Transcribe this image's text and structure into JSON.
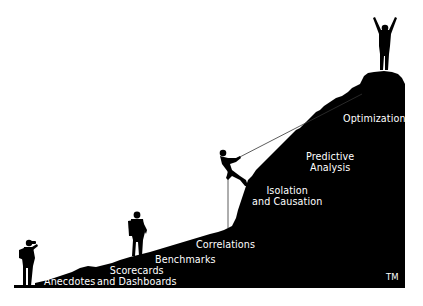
{
  "graphic": {
    "title": "Analytics maturity mountain",
    "colors": {
      "silhouette": "#000000",
      "background": "#ffffff",
      "label": "#ffffff",
      "rope": "#3a3a3a"
    },
    "figures": [
      {
        "name": "hiker-at-base",
        "icon": "person-with-binoculars-icon"
      },
      {
        "name": "hiker-on-slope",
        "icon": "hiker-with-backpack-icon"
      },
      {
        "name": "rope-climber",
        "icon": "climber-icon"
      },
      {
        "name": "summit-person",
        "icon": "celebrating-person-icon"
      }
    ],
    "stages": [
      {
        "line1": "Anecdotes",
        "line2": ""
      },
      {
        "line1": "Scorecards",
        "line2": "and Dashboards"
      },
      {
        "line1": "Benchmarks",
        "line2": ""
      },
      {
        "line1": "Correlations",
        "line2": ""
      },
      {
        "line1": "Isolation",
        "line2": "and Causation"
      },
      {
        "line1": "Predictive",
        "line2": "Analysis"
      },
      {
        "line1": "Optimization",
        "line2": ""
      }
    ],
    "trademark": "TM"
  }
}
